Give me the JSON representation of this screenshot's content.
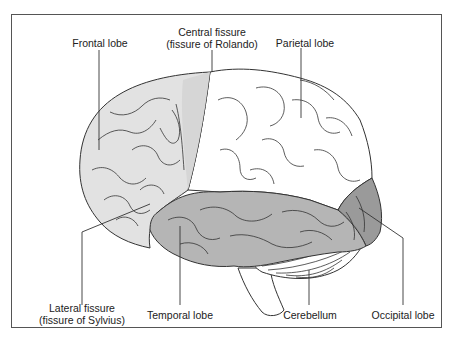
{
  "figure": {
    "colors": {
      "frontal_lobe": "#e2e2e2",
      "parietal_lobe": "#ffffff",
      "temporal_lobe": "#b5b5b5",
      "occipital_lobe": "#9a9a9a",
      "cerebellum": "#ffffff",
      "outline": "#333333",
      "frame": "#555555"
    },
    "labels": {
      "frontal_lobe": "Frontal lobe",
      "central_fissure_line1": "Central fissure",
      "central_fissure_line2": "(fissure of Rolando)",
      "parietal_lobe": "Parietal lobe",
      "lateral_fissure_line1": "Lateral fissure",
      "lateral_fissure_line2": "(fissure of Sylvius)",
      "temporal_lobe": "Temporal lobe",
      "cerebellum": "Cerebellum",
      "occipital_lobe": "Occipital lobe"
    }
  }
}
